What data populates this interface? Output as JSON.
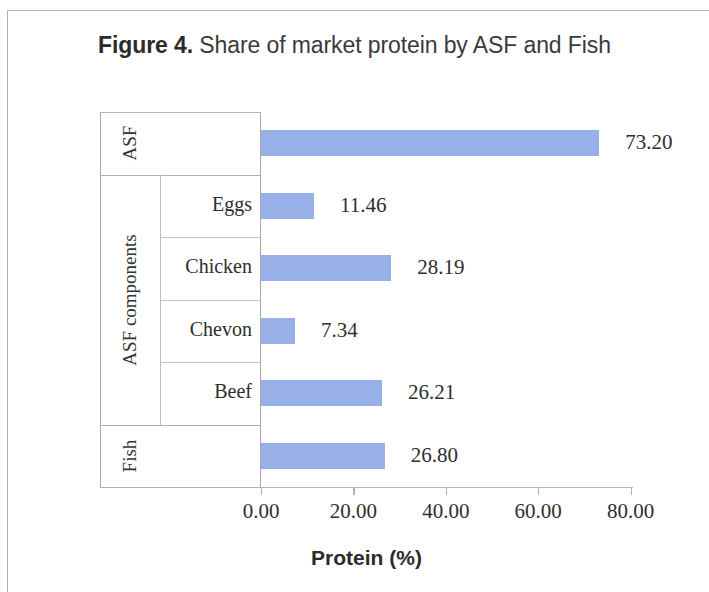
{
  "figure": {
    "title_lead": "Figure 4.",
    "title_rest": " Share of market protein by ASF and Fish"
  },
  "chart_data": {
    "type": "bar",
    "orientation": "horizontal",
    "title": "Figure 4. Share of market protein by ASF and Fish",
    "xlabel": "Protein (%)",
    "ylabel": "",
    "xlim": [
      0,
      80
    ],
    "xticks": [
      "0.00",
      "20.00",
      "40.00",
      "60.00",
      "80.00"
    ],
    "xtick_values": [
      0,
      20,
      40,
      60,
      80
    ],
    "grid": false,
    "legend": "none",
    "bar_color": "#97b0e8",
    "categories": [
      "ASF",
      "Eggs",
      "Chicken",
      "Chevon",
      "Beef",
      "Fish"
    ],
    "values": [
      73.2,
      11.46,
      28.19,
      7.34,
      26.21,
      26.8
    ],
    "value_labels": [
      "73.20",
      "11.46",
      "28.19",
      "7.34",
      "26.21",
      "26.80"
    ],
    "groups": [
      {
        "label": "ASF",
        "categories": [
          "ASF"
        ]
      },
      {
        "label": "ASF components",
        "categories": [
          "Eggs",
          "Chicken",
          "Chevon",
          "Beef"
        ]
      },
      {
        "label": "Fish",
        "categories": [
          "Fish"
        ]
      }
    ]
  }
}
